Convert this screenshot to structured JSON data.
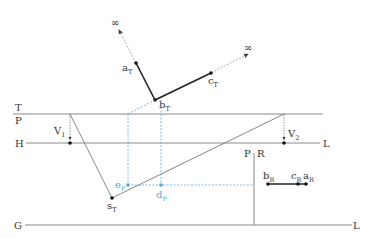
{
  "diagram": {
    "colors": {
      "line": "#8a8a8a",
      "heavy": "#222222",
      "blue": "#5aa6e0",
      "dashed_gray": "#9a9a9a"
    },
    "lines": {
      "T_label": "T",
      "P_label": "P",
      "H_label": "H",
      "L_label_H": "L",
      "G_label": "G",
      "L_label_G": "L",
      "PR_label_P": "P",
      "PR_label_R": "R"
    },
    "points": {
      "infinity_1": "∞",
      "infinity_2": "∞",
      "a_T": {
        "base": "a",
        "sub": "T"
      },
      "b_T": {
        "base": "b",
        "sub": "T"
      },
      "c_T": {
        "base": "c",
        "sub": "T"
      },
      "V_1": {
        "base": "V",
        "sub": "1"
      },
      "V_2": {
        "base": "V",
        "sub": "2"
      },
      "s_T": {
        "base": "s",
        "sub": "T"
      },
      "e_P": {
        "base": "e",
        "sub": "P"
      },
      "d_P": {
        "base": "d",
        "sub": "P"
      },
      "b_R": {
        "base": "b",
        "sub": "R"
      },
      "c_R": {
        "base": "c",
        "sub": "R"
      },
      "a_R": {
        "base": "a",
        "sub": "R"
      }
    }
  }
}
